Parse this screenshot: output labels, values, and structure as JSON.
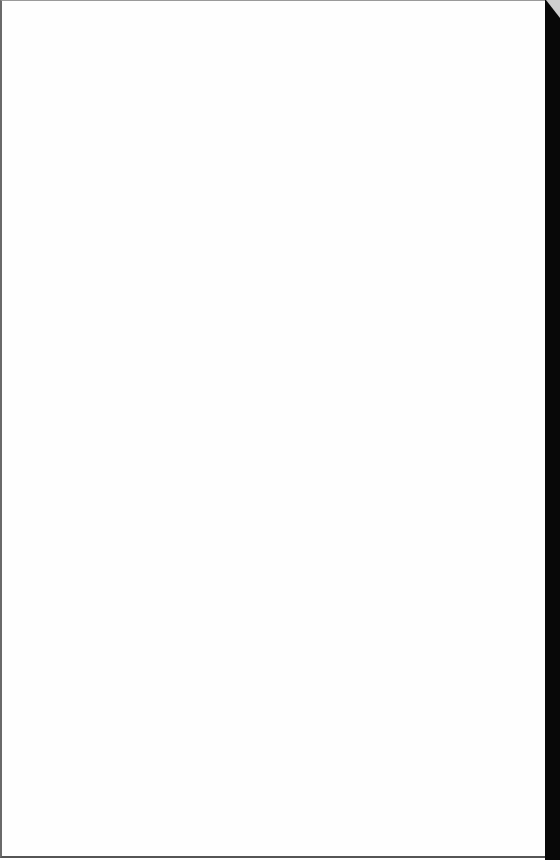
{
  "page": {
    "content": "",
    "background": "#fefefe"
  },
  "edge": {
    "color": "#080808"
  }
}
